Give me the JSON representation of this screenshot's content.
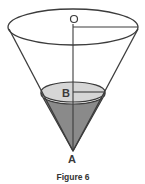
{
  "figure": {
    "caption": "Figure 6",
    "labels": {
      "top_center": "O",
      "liquid_center": "B",
      "apex": "A"
    },
    "colors": {
      "stroke": "#3c3c3c",
      "liquid_surface": "#d6d6d6",
      "liquid_body": "#8a8a8a",
      "background": "#ffffff"
    }
  }
}
